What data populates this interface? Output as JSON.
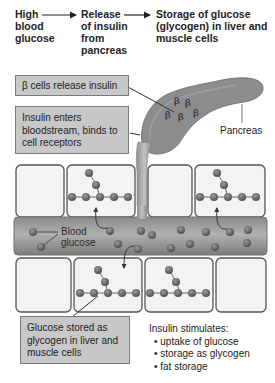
{
  "flow": {
    "step1": [
      "High",
      "blood",
      "glucose"
    ],
    "step2": [
      "Release",
      "of insulin",
      "from",
      "pancreas"
    ],
    "step3": [
      "Storage of glucose",
      "(glycogen) in liver and",
      "muscle cells"
    ]
  },
  "callouts": {
    "beta_cells": "β cells release insulin",
    "insulin_enters": [
      "Insulin enters",
      "bloodstream, binds to",
      "cell receptors"
    ],
    "glucose_stored": [
      "Glucose stored as",
      "glycogen in liver and",
      "muscle cells"
    ]
  },
  "labels": {
    "pancreas": "Pancreas",
    "blood_glucose": [
      "Blood",
      "glucose"
    ],
    "beta_symbol": "β"
  },
  "insulin_stimulates": {
    "title": "Insulin stimulates:",
    "items": [
      "uptake of glucose",
      "storage as glycogen",
      "fat storage"
    ]
  },
  "colors": {
    "callout_fill": "#c8c8c8",
    "pancreas": "#8a8a8a",
    "vessel": "#9a9a9a",
    "glucose": "#6e6e6e",
    "cell_fill": "#f2f2f2"
  }
}
